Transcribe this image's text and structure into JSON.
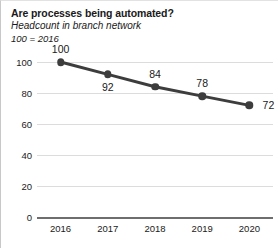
{
  "chart_data": {
    "type": "line",
    "title": "Are processes being automated?",
    "subtitle": "Headcount in branch network",
    "base_note": "100 = 2016",
    "xlabel": "",
    "ylabel": "",
    "categories": [
      "2016",
      "2017",
      "2018",
      "2019",
      "2020"
    ],
    "values": [
      100,
      92,
      84,
      78,
      72
    ],
    "point_labels": [
      "100",
      "92",
      "84",
      "78",
      "72"
    ],
    "label_positions": [
      "above",
      "below",
      "above",
      "above",
      "right"
    ],
    "ylim": [
      0,
      100
    ],
    "yticks": [
      "0",
      "20",
      "40",
      "60",
      "80",
      "100"
    ],
    "ytick_values": [
      0,
      20,
      40,
      60,
      80,
      100
    ],
    "grid": true,
    "legend": false,
    "series_color": "#3d3d3d",
    "grid_color": "#dcdcdc",
    "axis_color": "#6e6e6e",
    "text_color": "#1a1a1a",
    "background": "#ffffff"
  }
}
